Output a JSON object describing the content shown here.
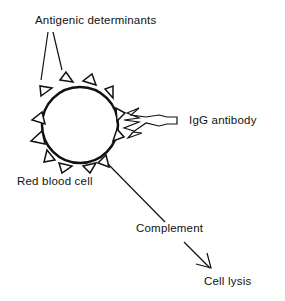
{
  "diagram": {
    "labels": {
      "antigenic_determinants": "Antigenic  determinants",
      "igg_antibody": "IgG  antibody",
      "red_blood_cell": "Red blood cell",
      "complement": "Complement",
      "cell_lysis": "Cell lysis"
    },
    "colors": {
      "stroke": "#111111",
      "background": "#ffffff"
    }
  }
}
